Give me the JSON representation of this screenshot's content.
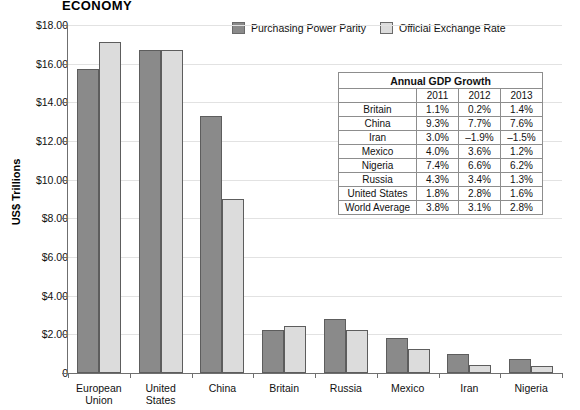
{
  "chart_data": {
    "type": "bar",
    "title": "ECONOMY",
    "xlabel": "",
    "ylabel": "US$ Trillions",
    "ylim": [
      0,
      18
    ],
    "grid": true,
    "legend_position": "top-center",
    "ytick_labels": [
      "$18.00",
      "$16.00",
      "$14.00",
      "$12.00",
      "$10.00",
      "$8.00",
      "$6.00",
      "$4.00",
      "$2.00",
      "0"
    ],
    "ytick_values": [
      18,
      16,
      14,
      12,
      10,
      8,
      6,
      4,
      2,
      0
    ],
    "categories": [
      "European Union",
      "United States",
      "China",
      "Britain",
      "Russia",
      "Mexico",
      "Iran",
      "Nigeria"
    ],
    "category_lines": [
      [
        "European",
        "Union"
      ],
      [
        "United",
        "States"
      ],
      [
        "China"
      ],
      [
        "Britain"
      ],
      [
        "Russia"
      ],
      [
        "Mexico"
      ],
      [
        "Iran"
      ],
      [
        "Nigeria"
      ]
    ],
    "series": [
      {
        "name": "Purchasing Power Parity",
        "color": "#8a8a8a",
        "values": [
          15.7,
          16.7,
          13.3,
          2.25,
          2.8,
          1.8,
          1.0,
          0.73
        ]
      },
      {
        "name": "Official Exchange Rate",
        "color": "#dcdcdc",
        "values": [
          17.1,
          16.7,
          9.0,
          2.45,
          2.25,
          1.25,
          0.42,
          0.37
        ]
      }
    ]
  },
  "table": {
    "title": "Annual GDP Growth",
    "corner": "",
    "columns": [
      "2011",
      "2012",
      "2013"
    ],
    "rows": [
      {
        "label": "Britain",
        "values": [
          "1.1%",
          "0.2%",
          "1.4%"
        ]
      },
      {
        "label": "China",
        "values": [
          "9.3%",
          "7.7%",
          "7.6%"
        ]
      },
      {
        "label": "Iran",
        "values": [
          "3.0%",
          "–1.9%",
          "–1.5%"
        ]
      },
      {
        "label": "Mexico",
        "values": [
          "4.0%",
          "3.6%",
          "1.2%"
        ]
      },
      {
        "label": "Nigeria",
        "values": [
          "7.4%",
          "6.6%",
          "6.2%"
        ]
      },
      {
        "label": "Russia",
        "values": [
          "4.3%",
          "3.4%",
          "1.3%"
        ]
      },
      {
        "label": "United States",
        "values": [
          "1.8%",
          "2.8%",
          "1.6%"
        ]
      },
      {
        "label": "World Average",
        "values": [
          "3.8%",
          "3.1%",
          "2.8%"
        ]
      }
    ]
  }
}
